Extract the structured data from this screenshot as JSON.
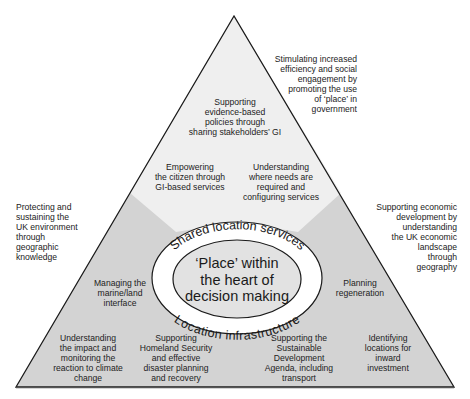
{
  "diagram": {
    "type": "pyramid-with-central-ellipse",
    "colors": {
      "top_region": "#efefef",
      "lower_regions": "#d3d3d3",
      "outer_ring": "#ffffff",
      "core": "#e2e2e2",
      "stroke": "#1a1a1a"
    },
    "core": {
      "lines": [
        "‘Place’ within",
        "the heart of",
        "decision making"
      ]
    },
    "ring": {
      "top_text": "Shared location services",
      "bottom_text": "Location infrastructure"
    },
    "inside_labels": {
      "top": [
        "Supporting",
        "evidence-based",
        "policies through",
        "sharing stakeholders’ GI"
      ],
      "upper_left": [
        "Empowering",
        "the citizen through",
        "GI-based services"
      ],
      "upper_right": [
        "Understanding",
        "where needs are",
        "required and",
        "configuring services"
      ],
      "mid_left": [
        "Managing the",
        "marine/land",
        "interface"
      ],
      "mid_right": [
        "Planning",
        "regeneration"
      ],
      "bottom_1": [
        "Understanding",
        "the impact and",
        "monitoring the",
        "reaction to climate",
        "change"
      ],
      "bottom_2": [
        "Supporting",
        "Homeland Security",
        "and effective",
        "disaster planning",
        "and recovery"
      ],
      "bottom_3": [
        "Supporting the",
        "Sustainable",
        "Development",
        "Agenda, including",
        "transport"
      ],
      "bottom_4": [
        "Identifying",
        "locations for",
        "inward",
        "investment"
      ]
    },
    "outside_labels": {
      "top_right": [
        "Stimulating increased",
        "efficiency and social",
        "engagement by",
        "promoting the use",
        "of ‘place’ in",
        "government"
      ],
      "left": [
        "Protecting and",
        "sustaining the",
        "UK environment",
        "through",
        "geographic",
        "knowledge"
      ],
      "right": [
        "Supporting economic",
        "development by",
        "understanding",
        "the UK economic",
        "landscape",
        "through",
        "geography"
      ]
    }
  }
}
